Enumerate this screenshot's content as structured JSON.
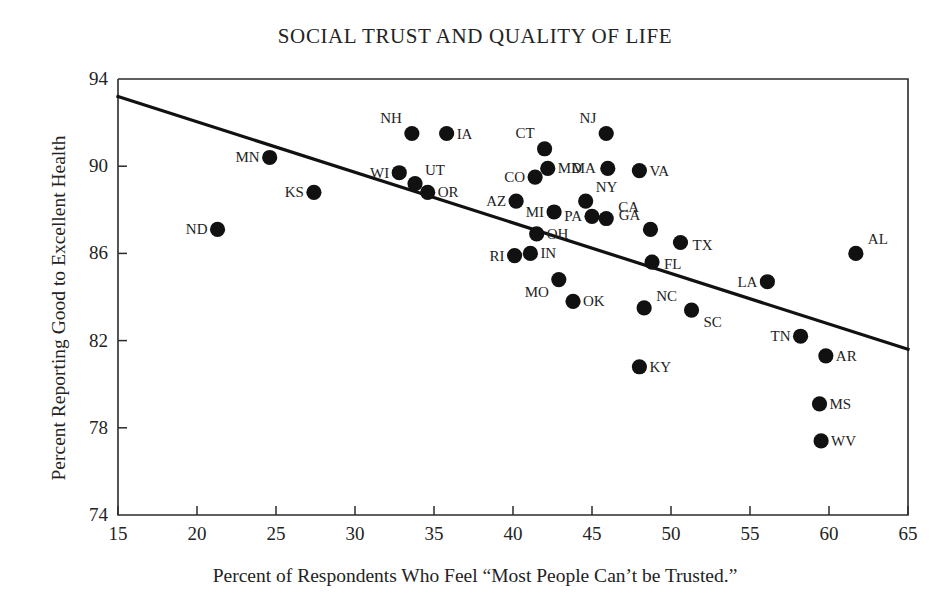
{
  "chart_data": {
    "type": "scatter",
    "title": "SOCIAL TRUST AND QUALITY OF LIFE",
    "xlabel": "Percent of Respondents Who Feel “Most People Can’t be Trusted.”",
    "ylabel": "Percent Reporting Good to Excellent Health",
    "xlim": [
      15,
      65
    ],
    "ylim": [
      74,
      94
    ],
    "xticks": [
      15,
      20,
      25,
      30,
      35,
      40,
      45,
      50,
      55,
      60,
      65
    ],
    "yticks": [
      74,
      78,
      82,
      86,
      90,
      94
    ],
    "grid": false,
    "legend": null,
    "marker_color": "#111111",
    "line_color": "#111111",
    "trendline": {
      "type": "linear-fit",
      "x_start": 15,
      "y_start": 93.2,
      "x_end": 65,
      "y_end": 81.6
    },
    "points": [
      {
        "label": "ND",
        "x": 21.3,
        "y": 87.1,
        "label_side": "left"
      },
      {
        "label": "MN",
        "x": 24.6,
        "y": 90.4,
        "label_side": "left"
      },
      {
        "label": "KS",
        "x": 27.4,
        "y": 88.8,
        "label_side": "left"
      },
      {
        "label": "WI",
        "x": 32.8,
        "y": 89.7,
        "label_side": "left"
      },
      {
        "label": "NH",
        "x": 33.6,
        "y": 91.5,
        "label_side": "left"
      },
      {
        "label": "UT",
        "x": 33.8,
        "y": 89.2,
        "label_side": "right"
      },
      {
        "label": "OR",
        "x": 34.6,
        "y": 88.8,
        "label_side": "right"
      },
      {
        "label": "IA",
        "x": 35.8,
        "y": 91.5,
        "label_side": "right"
      },
      {
        "label": "AZ",
        "x": 40.2,
        "y": 88.4,
        "label_side": "left"
      },
      {
        "label": "RI",
        "x": 40.1,
        "y": 85.9,
        "label_side": "left"
      },
      {
        "label": "IN",
        "x": 41.1,
        "y": 86.0,
        "label_side": "right"
      },
      {
        "label": "CO",
        "x": 41.4,
        "y": 89.5,
        "label_side": "left"
      },
      {
        "label": "OH",
        "x": 41.5,
        "y": 86.9,
        "label_side": "right"
      },
      {
        "label": "CT",
        "x": 42.0,
        "y": 90.8,
        "label_side": "left"
      },
      {
        "label": "MD",
        "x": 42.2,
        "y": 89.9,
        "label_side": "right"
      },
      {
        "label": "MI",
        "x": 42.6,
        "y": 87.9,
        "label_side": "left"
      },
      {
        "label": "MO",
        "x": 42.9,
        "y": 84.8,
        "label_side": "left"
      },
      {
        "label": "OK",
        "x": 43.8,
        "y": 83.8,
        "label_side": "right"
      },
      {
        "label": "NY",
        "x": 44.6,
        "y": 88.4,
        "label_side": "right"
      },
      {
        "label": "PA",
        "x": 45.0,
        "y": 87.7,
        "label_side": "left"
      },
      {
        "label": "NJ",
        "x": 45.9,
        "y": 91.5,
        "label_side": "left"
      },
      {
        "label": "MA",
        "x": 46.0,
        "y": 89.9,
        "label_side": "left"
      },
      {
        "label": "CA",
        "x": 45.9,
        "y": 87.6,
        "label_side": "right"
      },
      {
        "label": "VA",
        "x": 48.0,
        "y": 89.8,
        "label_side": "right"
      },
      {
        "label": "KY",
        "x": 48.0,
        "y": 80.8,
        "label_side": "right"
      },
      {
        "label": "NC",
        "x": 48.3,
        "y": 83.5,
        "label_side": "right"
      },
      {
        "label": "GA",
        "x": 48.7,
        "y": 87.1,
        "label_side": "left"
      },
      {
        "label": "FL",
        "x": 48.8,
        "y": 85.6,
        "label_side": "right"
      },
      {
        "label": "TX",
        "x": 50.6,
        "y": 86.5,
        "label_side": "right"
      },
      {
        "label": "SC",
        "x": 51.3,
        "y": 83.4,
        "label_side": "right"
      },
      {
        "label": "LA",
        "x": 56.1,
        "y": 84.7,
        "label_side": "left"
      },
      {
        "label": "TN",
        "x": 58.2,
        "y": 82.2,
        "label_side": "left"
      },
      {
        "label": "MS",
        "x": 59.4,
        "y": 79.1,
        "label_side": "right"
      },
      {
        "label": "WV",
        "x": 59.5,
        "y": 77.4,
        "label_side": "right"
      },
      {
        "label": "AR",
        "x": 59.8,
        "y": 81.3,
        "label_side": "right"
      },
      {
        "label": "AL",
        "x": 61.7,
        "y": 86.0,
        "label_side": "right"
      }
    ]
  }
}
